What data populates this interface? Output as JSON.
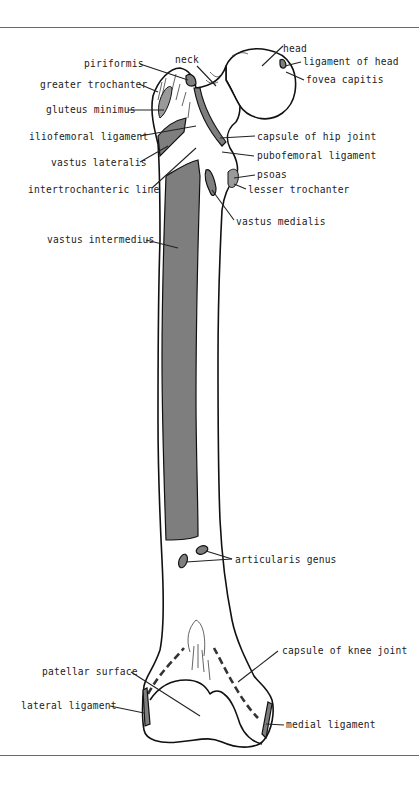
{
  "figure": {
    "colors": {
      "background": "#ffffff",
      "outline": "#111111",
      "muscle_attachment": "#7e7e7e",
      "rule": "#6a6a6a",
      "label_text": "#222222"
    },
    "labels": {
      "head": "head",
      "ligament_of_head": "ligament of head",
      "fovea_capitis": "fovea capitis",
      "neck": "neck",
      "piriformis": "piriformis",
      "greater_trochanter": "greater trochanter",
      "gluteus_minimus": "gluteus minimus",
      "iliofemoral_ligament": "iliofemoral ligament",
      "capsule_of_hip_joint": "capsule of hip joint",
      "pubofemoral_ligament": "pubofemoral ligament",
      "vastus_lateralis": "vastus lateralis",
      "psoas": "psoas",
      "lesser_trochanter": "lesser trochanter",
      "intertrochanteric_line": "intertrochanteric line",
      "vastus_medialis": "vastus medialis",
      "vastus_intermedius": "vastus intermedius",
      "articularis_genus": "articularis genus",
      "capsule_of_knee_joint": "capsule of knee joint",
      "patellar_surface": "patellar surface",
      "lateral_ligament": "lateral ligament",
      "medial_ligament": "medial ligament"
    }
  }
}
